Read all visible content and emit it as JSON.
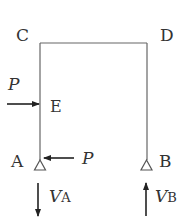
{
  "diagram": {
    "type": "portal-frame",
    "colors": {
      "line": "#555555",
      "text": "#333333",
      "arrow": "#222222"
    },
    "nodes": {
      "C": {
        "label": "C"
      },
      "D": {
        "label": "D"
      },
      "E": {
        "label": "E"
      },
      "A": {
        "label": "A"
      },
      "B": {
        "label": "B"
      }
    },
    "loads": {
      "at_E": {
        "symbol": "P",
        "direction": "right"
      },
      "at_A": {
        "symbol": "P",
        "direction": "left"
      }
    },
    "reactions": {
      "VA": {
        "main": "V",
        "sub": "A",
        "direction": "down"
      },
      "VB": {
        "main": "V",
        "sub": "B",
        "direction": "up"
      }
    }
  }
}
